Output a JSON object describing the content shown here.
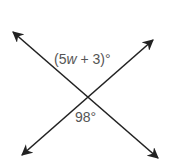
{
  "diagram": {
    "line_color": "#222222",
    "label_color": "#555555",
    "lines": [
      {
        "name": "line-1",
        "from": [
          13,
          32
        ],
        "to": [
          158,
          158
        ]
      },
      {
        "name": "line-2",
        "from": [
          22,
          155
        ],
        "to": [
          153,
          40
        ]
      }
    ],
    "intersection": [
      87,
      97
    ],
    "labels": {
      "top_angle_prefix": "(5",
      "top_angle_variable": "w",
      "top_angle_suffix": " + 3)°",
      "bottom_angle": "98°"
    }
  }
}
